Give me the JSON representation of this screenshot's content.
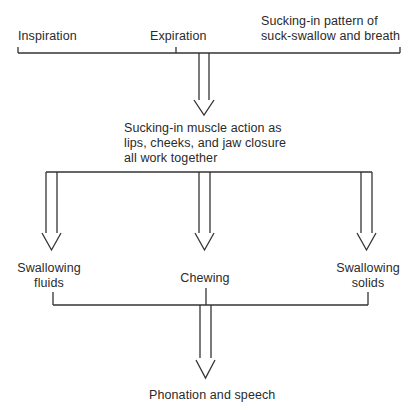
{
  "diagram": {
    "top": {
      "left_label": "Inspiration",
      "middle_label": "Expiration",
      "right_label_line1": "Sucking-in pattern of",
      "right_label_line2": "suck-swallow and breath"
    },
    "middle": {
      "line1": "Sucking-in muscle action as",
      "line2": "lips, cheeks, and jaw closure",
      "line3": "all work together"
    },
    "branches": {
      "left_line1": "Swallowing",
      "left_line2": "fluids",
      "center": "Chewing",
      "right_line1": "Swallowing",
      "right_line2": "solids"
    },
    "bottom": {
      "label": "Phonation and speech"
    }
  },
  "colors": {
    "line": "#333333",
    "text": "#2a2a2a",
    "background": "#ffffff"
  }
}
